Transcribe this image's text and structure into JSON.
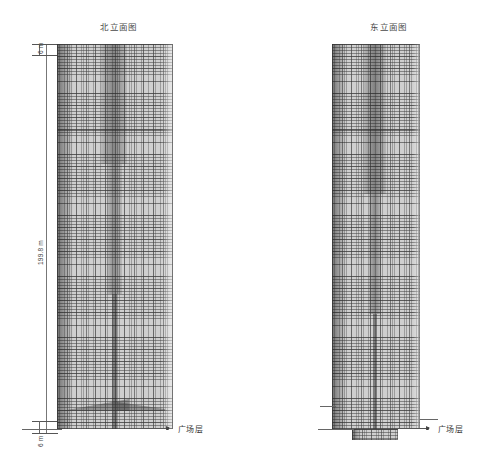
{
  "drawing": {
    "type": "architectural-elevation",
    "sheet_width": 488,
    "sheet_height": 470,
    "background_color": "#ffffff",
    "line_color": "#555555",
    "facade_color": "#cfcfcf"
  },
  "elevations": [
    {
      "id": "north",
      "title": "北立面图",
      "title_translation": "North Elevation",
      "tower": {
        "left": 57,
        "top": 44,
        "width": 116,
        "height": 385,
        "taper": "slight-inward",
        "facade_type": "curtain-wall-grid"
      },
      "base_feature": "plaza-canopy-wedge"
    },
    {
      "id": "east",
      "title": "东立面图",
      "title_translation": "East Elevation",
      "tower": {
        "left": 332,
        "top": 44,
        "width": 88,
        "height": 385,
        "taper": "slight-inward",
        "facade_type": "curtain-wall-grid"
      },
      "base_feature": "stepped-podium"
    }
  ],
  "dimensions": {
    "top": {
      "label": "6 m",
      "value": 6,
      "unit": "m",
      "orientation": "vertical"
    },
    "main": {
      "label": "199.8 m",
      "value": 199.8,
      "unit": "m",
      "orientation": "vertical"
    },
    "bottom": {
      "label": "6 m",
      "value": 6,
      "unit": "m",
      "orientation": "vertical"
    }
  },
  "callouts": [
    {
      "id": "north-plaza",
      "label": "广场层",
      "label_translation": "Plaza Level",
      "target_elevation": "north"
    },
    {
      "id": "east-plaza",
      "label": "广场层",
      "label_translation": "Plaza Level",
      "target_elevation": "east"
    }
  ]
}
